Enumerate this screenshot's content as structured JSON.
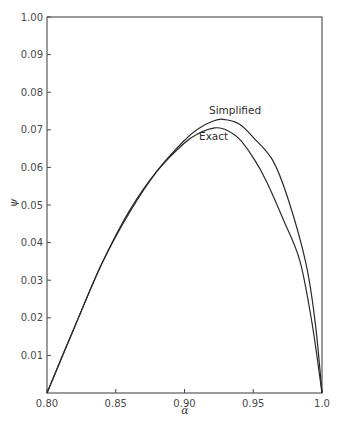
{
  "chart_data": {
    "type": "line",
    "title": "",
    "xlabel": "α",
    "ylabel": "ψ",
    "xlim": [
      0.8,
      1.0
    ],
    "ylim": [
      0.0,
      0.1
    ],
    "grid": false,
    "legend": "inline labels near curve peaks",
    "x_ticks": [
      "0.80",
      "0.85",
      "0.90",
      "0.95",
      "1.0"
    ],
    "y_ticks": [
      "0.01",
      "0.02",
      "0.03",
      "0.04",
      "0.05",
      "0.06",
      "0.07",
      "0.08",
      "0.09",
      "1.00"
    ],
    "series": [
      {
        "name": "Simplified",
        "x": [
          0.8,
          0.82,
          0.84,
          0.86,
          0.88,
          0.9,
          0.91,
          0.92,
          0.928,
          0.94,
          0.95,
          0.964,
          0.975,
          0.988,
          0.995,
          1.0
        ],
        "y": [
          0.0,
          0.0175,
          0.0345,
          0.048,
          0.059,
          0.0672,
          0.0703,
          0.0722,
          0.0728,
          0.0715,
          0.068,
          0.062,
          0.052,
          0.035,
          0.019,
          0.0
        ]
      },
      {
        "name": "Exact",
        "x": [
          0.8,
          0.82,
          0.84,
          0.86,
          0.88,
          0.9,
          0.91,
          0.922,
          0.93,
          0.94,
          0.951,
          0.96,
          0.972,
          0.984,
          0.993,
          1.0
        ],
        "y": [
          0.0,
          0.0175,
          0.0345,
          0.0485,
          0.059,
          0.0665,
          0.069,
          0.0705,
          0.07,
          0.0675,
          0.062,
          0.056,
          0.046,
          0.035,
          0.018,
          0.0
        ]
      }
    ],
    "annotations": [
      {
        "text": "Simplified",
        "near": "peak of upper curve"
      },
      {
        "text": "Exact",
        "near": "peak of lower curve"
      }
    ]
  }
}
